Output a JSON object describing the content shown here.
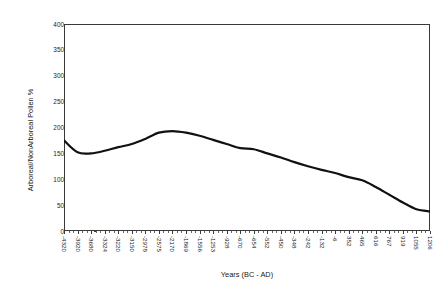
{
  "chart_data": {
    "type": "line",
    "title": "",
    "xlabel": "Years (BC - AD)",
    "ylabel": "Arboreal/NonArboreal Pollen %",
    "ylim": [
      0,
      400
    ],
    "ytick_labels": [
      "400",
      "350",
      "300",
      "250",
      "200",
      "150",
      "100",
      "50",
      "0"
    ],
    "ytick_values": [
      400,
      350,
      300,
      250,
      200,
      150,
      100,
      50,
      0
    ],
    "grid": false,
    "legend": "none",
    "categories": [
      "-4320",
      "-3920",
      "-3680",
      "-3324",
      "-3220",
      "-3150",
      "-2978",
      "-2575",
      "-2170",
      "-1869",
      "-1556",
      "-1253",
      "-928",
      "-670",
      "-654",
      "-552",
      "-450",
      "-348",
      "-242",
      "-132",
      "-6",
      "352",
      "465",
      "616",
      "767",
      "919",
      "1055",
      "1206"
    ],
    "values": [
      175,
      152,
      150,
      155,
      162,
      168,
      178,
      190,
      193,
      190,
      184,
      176,
      168,
      160,
      158,
      150,
      142,
      133,
      125,
      118,
      112,
      104,
      98,
      85,
      70,
      55,
      42,
      38
    ],
    "series": [
      {
        "name": "Arboreal/NonArboreal Pollen %",
        "color": "#111111",
        "values": [
          175,
          152,
          150,
          155,
          162,
          168,
          178,
          190,
          193,
          190,
          184,
          176,
          168,
          160,
          158,
          150,
          142,
          133,
          125,
          118,
          112,
          104,
          98,
          85,
          70,
          55,
          42,
          38
        ]
      }
    ],
    "line_color": "#111111",
    "line_width": 2.2,
    "frame_color": "#3a3a3a",
    "background": "#ffffff"
  }
}
